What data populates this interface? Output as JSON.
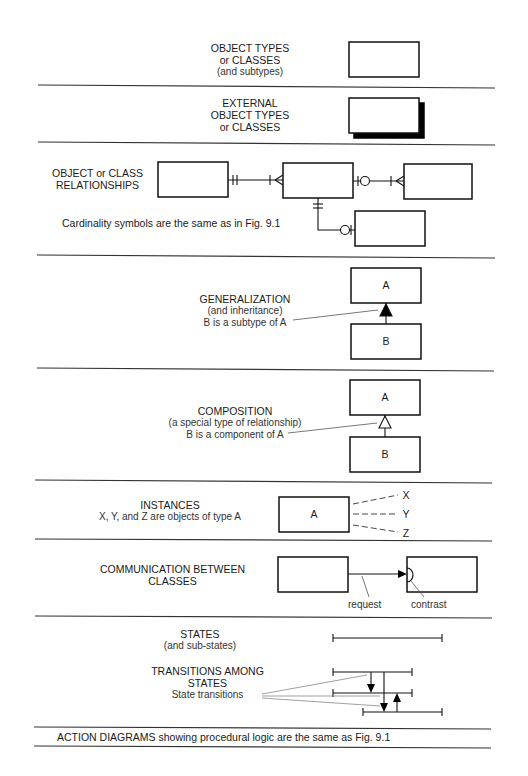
{
  "sections": {
    "object_types": {
      "lines": [
        "OBJECT TYPES",
        "or CLASSES"
      ],
      "sub": "(and subtypes)"
    },
    "external": {
      "lines": [
        "EXTERNAL",
        "OBJECT TYPES",
        "or CLASSES"
      ]
    },
    "relationships": {
      "lines": [
        "OBJECT or CLASS",
        "RELATIONSHIPS"
      ],
      "note": "Cardinality symbols are the same as in Fig. 9.1"
    },
    "generalization": {
      "title": "GENERALIZATION",
      "sub": "(and inheritance)",
      "note": "B is a subtype of A",
      "box_a": "A",
      "box_b": "B"
    },
    "composition": {
      "title": "COMPOSITION",
      "sub": "(a special type of relationship)",
      "note": "B is a component of A",
      "box_a": "A",
      "box_b": "B"
    },
    "instances": {
      "title": "INSTANCES",
      "sub": "X, Y, and Z are objects of type A",
      "box": "A",
      "labels": [
        "X",
        "Y",
        "Z"
      ]
    },
    "communication": {
      "lines": [
        "COMMUNICATION BETWEEN",
        "CLASSES"
      ],
      "request": "request",
      "contrast": "contrast"
    },
    "states": {
      "title": "STATES",
      "sub": "(and sub-states)"
    },
    "transitions": {
      "lines": [
        "TRANSITIONS AMONG",
        "STATES"
      ],
      "note": "State transitions"
    },
    "action": {
      "text": "ACTION DIAGRAMS showing procedural logic are the same as Fig. 9.1"
    }
  }
}
